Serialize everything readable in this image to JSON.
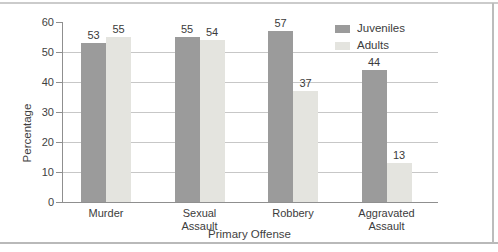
{
  "figure": {
    "background": "#ffffff",
    "rule_top_color": "#cbcbcb",
    "rule_bottom_color": "#b9b9b9",
    "rule_right_color": "#bcbcbc"
  },
  "chart_data": {
    "type": "bar",
    "title": "",
    "xlabel": "Primary Offense",
    "ylabel": "Percentage",
    "categories": [
      "Murder",
      "Sexual Assault",
      "Robbery",
      "Aggravated Assault"
    ],
    "series": [
      {
        "name": "Juveniles",
        "color": "#9b9b9b",
        "values": [
          53,
          55,
          57,
          44
        ]
      },
      {
        "name": "Adults",
        "color": "#e4e4df",
        "values": [
          55,
          54,
          37,
          13
        ]
      }
    ],
    "ylim": [
      0,
      60
    ],
    "yticks": [
      0,
      10,
      20,
      30,
      40,
      50,
      60
    ],
    "grid": true,
    "legend_position": "top-right",
    "axis_color": "#8f8f8f",
    "gridline_color": "#c7c7c7",
    "text_color": "#3b3b3b"
  }
}
